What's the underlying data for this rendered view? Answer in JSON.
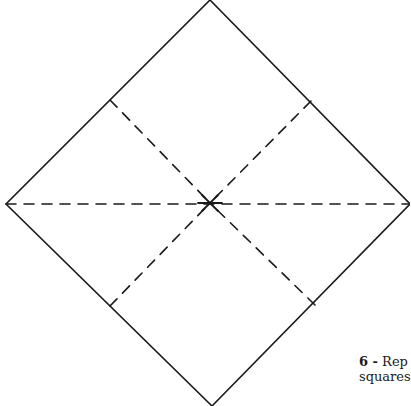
{
  "diagram": {
    "stroke_color": "#1a1a1a",
    "background": "#ffffff",
    "outline": {
      "top": [
        210,
        0
      ],
      "right": [
        410,
        204
      ],
      "bottom": [
        212,
        406
      ],
      "left": [
        6,
        204
      ]
    },
    "center": [
      210,
      203
    ],
    "fold_lines": [
      {
        "name": "horizontal-crease",
        "from": [
          6,
          204
        ],
        "to": [
          410,
          204
        ]
      },
      {
        "name": "diagonal-crease-upper-left",
        "from": [
          110,
          100
        ],
        "to": [
          210,
          203
        ]
      },
      {
        "name": "diagonal-crease-upper-right",
        "from": [
          311,
          101
        ],
        "to": [
          210,
          203
        ]
      },
      {
        "name": "diagonal-crease-lower-left",
        "from": [
          110,
          306
        ],
        "to": [
          210,
          203
        ]
      },
      {
        "name": "diagonal-crease-lower-right",
        "from": [
          315,
          305
        ],
        "to": [
          210,
          203
        ]
      }
    ]
  },
  "caption": {
    "step_number": "6 -",
    "line1": "Rep",
    "line2": "squares"
  }
}
